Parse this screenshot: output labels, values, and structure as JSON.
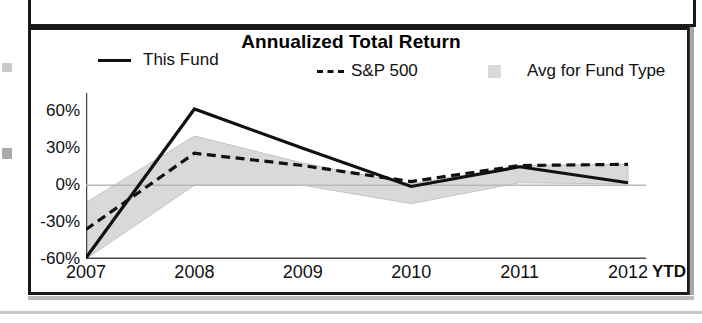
{
  "chart_data": {
    "type": "line",
    "title": "Annualized Total Return",
    "xlabel": "",
    "ylabel": "",
    "categories": [
      "2007",
      "2008",
      "2009",
      "2010",
      "2011",
      "2012"
    ],
    "x_axis_note": "YTD",
    "ylim": [
      -60,
      75
    ],
    "ytick_labels": [
      "60%",
      "30%",
      "0%",
      "-30%",
      "-60%"
    ],
    "ytick_values": [
      60,
      30,
      0,
      -30,
      -60
    ],
    "grid": false,
    "zero_line": true,
    "legend_position": "top",
    "series": [
      {
        "name": "This Fund",
        "style": "solid",
        "color": "#111111",
        "values": [
          -59,
          62,
          30,
          -1,
          15,
          2
        ]
      },
      {
        "name": "S&P 500",
        "style": "dashed",
        "color": "#111111",
        "values": [
          -36,
          26,
          16,
          3,
          16,
          17
        ]
      }
    ],
    "band": {
      "name": "Avg for Fund Type",
      "color": "#d9d9d9",
      "upper": [
        -14,
        40,
        18,
        1,
        16,
        17
      ],
      "lower": [
        -60,
        0,
        0,
        -15,
        2,
        1
      ]
    }
  },
  "chart": {
    "title": "Annualized Total Return",
    "legend": [
      {
        "label": "This Fund",
        "marker": "solid-line-swatch"
      },
      {
        "label": "S&P 500",
        "marker": "dashed-line-swatch"
      },
      {
        "label": "Avg for Fund Type",
        "marker": "gray-area-swatch"
      }
    ],
    "y_ticks": [
      "60%",
      "30%",
      "0%",
      "-30%",
      "-60%"
    ],
    "x_ticks": [
      "2007",
      "2008",
      "2009",
      "2010",
      "2011",
      "2012"
    ],
    "ytd_label": "YTD"
  },
  "colors": {
    "line": "#111111",
    "band": "#d9d9d9",
    "frame": "#1a1a1a",
    "axis": "#4a4a4a"
  }
}
